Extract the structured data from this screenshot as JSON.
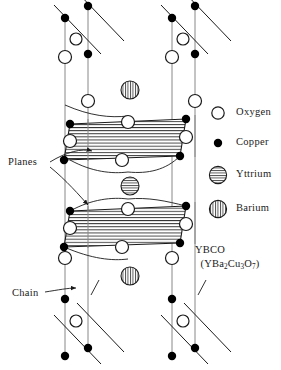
{
  "figure": {
    "title_label": "YBCO",
    "formula": {
      "open_paren": "(",
      "y": "Y",
      "ba": "Ba",
      "ba_sub": "2",
      "cu": "Cu",
      "cu_sub": "3",
      "o": "O",
      "o_sub": "7",
      "close_paren": ")",
      "plain": "(YBa2Cu3O7)"
    }
  },
  "annotations": [
    {
      "label": "Planes",
      "x": 10,
      "y": 163
    },
    {
      "label": "Chain",
      "x": 12,
      "y": 295
    }
  ],
  "legend": {
    "items": [
      {
        "label": "Oxygen",
        "icon": "open-circle-icon",
        "fill": "#ffffff",
        "stroke": "#000000",
        "pattern": "none",
        "r": 6.0,
        "cx": 218,
        "cy": 113,
        "text_x": 236,
        "text_y": 108
      },
      {
        "label": "Copper",
        "icon": "filled-circle-icon",
        "fill": "#000000",
        "stroke": "#000000",
        "pattern": "none",
        "r": 4.0,
        "cx": 218,
        "cy": 143,
        "text_x": 236,
        "text_y": 138
      },
      {
        "label": "Yttrium",
        "icon": "horizontal-striped-circle-icon",
        "fill": "#ffffff",
        "stroke": "#000000",
        "pattern": "horizontal",
        "r": 8.0,
        "cx": 218,
        "cy": 175,
        "text_x": 236,
        "text_y": 170
      },
      {
        "label": "Barium",
        "icon": "vertical-striped-circle-icon",
        "fill": "#ffffff",
        "stroke": "#000000",
        "pattern": "vertical",
        "r": 8.0,
        "cx": 218,
        "cy": 209,
        "text_x": 236,
        "text_y": 204
      }
    ]
  },
  "colors": {
    "line": "#000000",
    "axis_line": "#777777",
    "hatch": "#222222",
    "copper": "#000000",
    "oxygen_fill": "#ffffff",
    "text": "#1a1a1a",
    "background": "#ffffff"
  },
  "structure": {
    "type": "crystal-unit-cell",
    "description": "YBCO orthorhombic unit cell with two CuO2 planes and CuO chain layers",
    "vertical_axes": [
      {
        "x_top": 65,
        "y_top": 18,
        "x_bottom": 65,
        "y_bottom": 350
      },
      {
        "x_top": 88,
        "y_top": 0,
        "x_bottom": 88,
        "y_bottom": 360
      },
      {
        "x_top": 172,
        "y_top": 18,
        "x_bottom": 172,
        "y_bottom": 350
      },
      {
        "x_top": 195,
        "y_top": 0,
        "x_bottom": 195,
        "y_bottom": 360
      }
    ],
    "planes": [
      {
        "name": "upper-cuo2-plane",
        "points": [
          [
            70,
            124
          ],
          [
            186,
            119
          ],
          [
            180,
            156
          ],
          [
            64,
            160
          ]
        ],
        "hatch": "horizontal"
      },
      {
        "name": "lower-cuo2-plane",
        "points": [
          [
            70,
            211
          ],
          [
            186,
            206
          ],
          [
            180,
            243
          ],
          [
            64,
            247
          ]
        ],
        "hatch": "horizontal"
      }
    ],
    "chain_segments": [
      {
        "x1": 55,
        "y1": 4,
        "x2": 100,
        "y2": 52
      },
      {
        "x1": 78,
        "y1": -8,
        "x2": 123,
        "y2": 40
      },
      {
        "x1": 162,
        "y1": 4,
        "x2": 207,
        "y2": 52
      },
      {
        "x1": 185,
        "y1": -8,
        "x2": 230,
        "y2": 40
      },
      {
        "x1": 55,
        "y1": 316,
        "x2": 100,
        "y2": 364
      },
      {
        "x1": 78,
        "y1": 304,
        "x2": 123,
        "y2": 352
      },
      {
        "x1": 162,
        "y1": 316,
        "x2": 207,
        "y2": 364
      },
      {
        "x1": 185,
        "y1": 304,
        "x2": 230,
        "y2": 352
      }
    ],
    "atoms": {
      "copper": [
        {
          "cx": 65,
          "cy": 18,
          "layer": "top-chain"
        },
        {
          "cx": 88,
          "cy": 6,
          "layer": "top-chain"
        },
        {
          "cx": 172,
          "cy": 18,
          "layer": "top-chain"
        },
        {
          "cx": 195,
          "cy": 6,
          "layer": "top-chain"
        },
        {
          "cx": 88,
          "cy": 54,
          "layer": "top-chain"
        },
        {
          "cx": 195,
          "cy": 54,
          "layer": "top-chain"
        },
        {
          "cx": 70,
          "cy": 124,
          "layer": "upper-plane"
        },
        {
          "cx": 186,
          "cy": 119,
          "layer": "upper-plane"
        },
        {
          "cx": 64,
          "cy": 160,
          "layer": "upper-plane"
        },
        {
          "cx": 180,
          "cy": 156,
          "layer": "upper-plane"
        },
        {
          "cx": 70,
          "cy": 211,
          "layer": "lower-plane"
        },
        {
          "cx": 186,
          "cy": 206,
          "layer": "lower-plane"
        },
        {
          "cx": 64,
          "cy": 247,
          "layer": "lower-plane"
        },
        {
          "cx": 180,
          "cy": 243,
          "layer": "lower-plane"
        },
        {
          "cx": 65,
          "cy": 299,
          "layer": "bottom-chain"
        },
        {
          "cx": 172,
          "cy": 299,
          "layer": "bottom-chain"
        },
        {
          "cx": 88,
          "cy": 348,
          "layer": "bottom-chain"
        },
        {
          "cx": 195,
          "cy": 348,
          "layer": "bottom-chain"
        },
        {
          "cx": 65,
          "cy": 355,
          "layer": "bottom-chain"
        },
        {
          "cx": 172,
          "cy": 355,
          "layer": "bottom-chain"
        }
      ],
      "oxygen": [
        {
          "cx": 76,
          "cy": 39,
          "layer": "top-chain"
        },
        {
          "cx": 183,
          "cy": 39,
          "layer": "top-chain"
        },
        {
          "cx": 65,
          "cy": 57,
          "layer": "top-chain"
        },
        {
          "cx": 172,
          "cy": 57,
          "layer": "top-chain"
        },
        {
          "cx": 88,
          "cy": 101,
          "layer": "apical"
        },
        {
          "cx": 195,
          "cy": 101,
          "layer": "apical"
        },
        {
          "cx": 128,
          "cy": 122,
          "layer": "upper-plane"
        },
        {
          "cx": 70,
          "cy": 141,
          "layer": "upper-plane"
        },
        {
          "cx": 186,
          "cy": 137,
          "layer": "upper-plane"
        },
        {
          "cx": 122,
          "cy": 158,
          "layer": "upper-plane"
        },
        {
          "cx": 128,
          "cy": 209,
          "layer": "lower-plane"
        },
        {
          "cx": 70,
          "cy": 228,
          "layer": "lower-plane"
        },
        {
          "cx": 186,
          "cy": 224,
          "layer": "lower-plane"
        },
        {
          "cx": 122,
          "cy": 245,
          "layer": "lower-plane"
        },
        {
          "cx": 65,
          "cy": 258,
          "layer": "apical"
        },
        {
          "cx": 172,
          "cy": 258,
          "layer": "apical"
        },
        {
          "cx": 76,
          "cy": 321,
          "layer": "bottom-chain"
        },
        {
          "cx": 183,
          "cy": 321,
          "layer": "bottom-chain"
        }
      ],
      "barium": [
        {
          "cx": 130,
          "cy": 90,
          "layer": "upper-barium"
        },
        {
          "cx": 130,
          "cy": 276,
          "layer": "lower-barium"
        }
      ],
      "yttrium": [
        {
          "cx": 130,
          "cy": 186,
          "layer": "between-planes"
        }
      ]
    },
    "leader_lines": [
      {
        "name": "planes-leader-upper",
        "from": [
          52,
          162
        ],
        "to": [
          96,
          150
        ],
        "curve": [
          74,
          148
        ]
      },
      {
        "name": "planes-leader-lower",
        "from": [
          52,
          166
        ],
        "to": [
          90,
          207
        ],
        "curve": [
          74,
          188
        ]
      },
      {
        "name": "chain-leader",
        "from": [
          48,
          292
        ],
        "to": [
          78,
          287
        ],
        "curve": [
          64,
          288
        ]
      }
    ]
  }
}
